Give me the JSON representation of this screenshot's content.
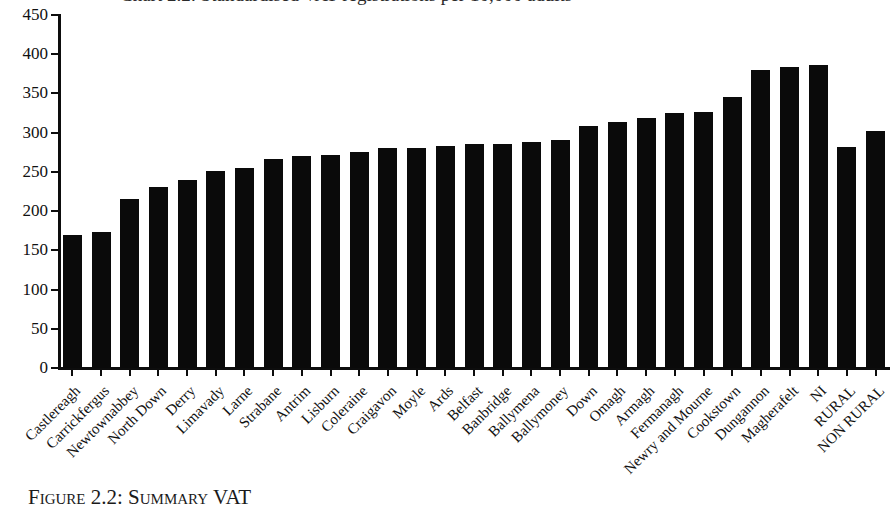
{
  "figure": {
    "title_sliver": "Chart 2.2: Standardised VAT registrations per 10,000 adults",
    "caption": "Figure 2.2: Summary VAT"
  },
  "chart_data": {
    "type": "bar",
    "title": "",
    "xlabel": "",
    "ylabel": "",
    "ylim": [
      0,
      450
    ],
    "yticks": [
      0,
      50,
      100,
      150,
      200,
      250,
      300,
      350,
      400,
      450
    ],
    "ytick_labels": [
      "0",
      "50",
      "100",
      "150",
      "200",
      "250",
      "300",
      "350",
      "400",
      "450"
    ],
    "grid": false,
    "legend": "none",
    "bar_color": "#0a0a0a",
    "categories": [
      "Castlereagh",
      "Carrickfergus",
      "Newtownabbey",
      "North Down",
      "Derry",
      "Limavady",
      "Larne",
      "Strabane",
      "Antrim",
      "Lisburn",
      "Coleraine",
      "Craigavon",
      "Moyle",
      "Ards",
      "Belfast",
      "Banbridge",
      "Ballymena",
      "Ballymoney",
      "Down",
      "Omagh",
      "Armagh",
      "Fermanagh",
      "Newry and Mourne",
      "Cookstown",
      "Dungannon",
      "Magherafelt",
      "NI",
      "RURAL",
      "NON RURAL"
    ],
    "values": [
      170,
      173,
      215,
      231,
      240,
      251,
      255,
      267,
      270,
      272,
      276,
      280,
      281,
      283,
      285,
      286,
      288,
      291,
      308,
      313,
      319,
      325,
      327,
      345,
      380,
      384,
      386,
      282,
      302
    ],
    "series": [
      {
        "name": "VAT registrations per 10,000 adults",
        "values": [
          170,
          173,
          215,
          231,
          240,
          251,
          255,
          267,
          270,
          272,
          276,
          280,
          281,
          283,
          285,
          286,
          288,
          291,
          308,
          313,
          319,
          325,
          327,
          345,
          380,
          384,
          386,
          282,
          302
        ]
      }
    ],
    "note_order": "Categories ordered ascending by value, with NI, RURAL and NON RURAL summary bars appended at the right; NON RURAL = 251"
  }
}
